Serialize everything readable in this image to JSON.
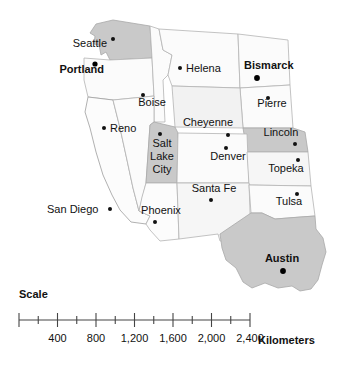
{
  "map": {
    "title": "Western United States reference map",
    "colors": {
      "background": "#ffffff",
      "state_fill_light": "#f7f7f7",
      "state_fill_lighter": "#fafafa",
      "state_fill_shaded": "#c9c9c9",
      "state_fill_shaded_light": "#d6d6d6",
      "state_border": "#b4b4b4",
      "coast_border": "#8f8f8f",
      "label_color": "#111111",
      "dot_color": "#111111"
    },
    "states": [
      {
        "name": "Washington",
        "shaded": true,
        "fill": "#c9c9c9"
      },
      {
        "name": "Oregon",
        "shaded": false,
        "fill": "#fafafa"
      },
      {
        "name": "Idaho",
        "shaded": false,
        "fill": "#fafafa"
      },
      {
        "name": "Montana",
        "shaded": false,
        "fill": "#fafafa"
      },
      {
        "name": "North Dakota",
        "shaded": false,
        "fill": "#fafafa"
      },
      {
        "name": "South Dakota",
        "shaded": false,
        "fill": "#fafafa"
      },
      {
        "name": "Wyoming",
        "shaded": false,
        "fill": "#f4f4f4"
      },
      {
        "name": "Nebraska",
        "shaded": true,
        "fill": "#c9c9c9"
      },
      {
        "name": "California",
        "shaded": false,
        "fill": "#fcfcfc"
      },
      {
        "name": "Nevada",
        "shaded": false,
        "fill": "#fafafa"
      },
      {
        "name": "Utah",
        "shaded": true,
        "fill": "#c9c9c9"
      },
      {
        "name": "Colorado",
        "shaded": false,
        "fill": "#fafafa"
      },
      {
        "name": "Kansas",
        "shaded": false,
        "fill": "#f7f7f7"
      },
      {
        "name": "Arizona",
        "shaded": false,
        "fill": "#fcfcfc"
      },
      {
        "name": "New Mexico",
        "shaded": false,
        "fill": "#f7f7f7"
      },
      {
        "name": "Oklahoma",
        "shaded": false,
        "fill": "#fafafa"
      },
      {
        "name": "Texas",
        "shaded": true,
        "fill": "#c9c9c9"
      }
    ],
    "cities": [
      {
        "label": "Seattle",
        "bold": false,
        "anchor": "end",
        "label_x": 107,
        "label_y": 47,
        "dot_x": 113,
        "dot_y": 39,
        "dot_r": 2.0
      },
      {
        "label": "Portland",
        "bold": true,
        "anchor": "end",
        "label_x": 104,
        "label_y": 73,
        "dot_x": 95,
        "dot_y": 64,
        "dot_r": 2.6
      },
      {
        "label": "Helena",
        "bold": false,
        "anchor": "start",
        "label_x": 186,
        "label_y": 72,
        "dot_x": 180,
        "dot_y": 68,
        "dot_r": 2.0
      },
      {
        "label": "Bismarck",
        "bold": true,
        "anchor": "start",
        "label_x": 244,
        "label_y": 69,
        "dot_x": 257,
        "dot_y": 78,
        "dot_r": 2.9
      },
      {
        "label": "Boise",
        "bold": false,
        "anchor": "middle",
        "label_x": 152,
        "label_y": 106,
        "dot_x": 143,
        "dot_y": 95,
        "dot_r": 2.0
      },
      {
        "label": "Pierre",
        "bold": false,
        "anchor": "middle",
        "label_x": 272,
        "label_y": 107,
        "dot_x": 268,
        "dot_y": 98,
        "dot_r": 2.0
      },
      {
        "label": "Cheyenne",
        "bold": false,
        "anchor": "middle",
        "label_x": 208,
        "label_y": 126,
        "dot_x": 228,
        "dot_y": 135,
        "dot_r": 2.0
      },
      {
        "label": "Reno",
        "bold": false,
        "anchor": "start",
        "label_x": 110,
        "label_y": 132,
        "dot_x": 104,
        "dot_y": 128,
        "dot_r": 2.0
      },
      {
        "label": "Lincoln",
        "bold": false,
        "anchor": "middle",
        "label_x": 281,
        "label_y": 136,
        "dot_x": 295,
        "dot_y": 144,
        "dot_r": 2.0
      },
      {
        "label": "Salt",
        "bold": false,
        "anchor": "middle",
        "label_x": 162,
        "label_y": 147,
        "dot_x": 160,
        "dot_y": 134,
        "dot_r": 2.0
      },
      {
        "label": "Lake",
        "bold": false,
        "anchor": "middle",
        "label_x": 162,
        "label_y": 160,
        "dot_x": null,
        "dot_y": null,
        "dot_r": 0
      },
      {
        "label": "City",
        "bold": false,
        "anchor": "middle",
        "label_x": 162,
        "label_y": 173,
        "dot_x": null,
        "dot_y": null,
        "dot_r": 0
      },
      {
        "label": "Denver",
        "bold": false,
        "anchor": "middle",
        "label_x": 228,
        "label_y": 160,
        "dot_x": 226,
        "dot_y": 148,
        "dot_r": 2.0
      },
      {
        "label": "Topeka",
        "bold": false,
        "anchor": "middle",
        "label_x": 286,
        "label_y": 172,
        "dot_x": 298,
        "dot_y": 160,
        "dot_r": 2.0
      },
      {
        "label": "Santa Fe",
        "bold": false,
        "anchor": "middle",
        "label_x": 214,
        "label_y": 192,
        "dot_x": 211,
        "dot_y": 200,
        "dot_r": 2.0
      },
      {
        "label": "Tulsa",
        "bold": false,
        "anchor": "middle",
        "label_x": 289,
        "label_y": 205,
        "dot_x": 297,
        "dot_y": 194,
        "dot_r": 2.0
      },
      {
        "label": "San Diego",
        "bold": false,
        "anchor": "start",
        "label_x": 47,
        "label_y": 213,
        "dot_x": 110,
        "dot_y": 209,
        "dot_r": 2.0
      },
      {
        "label": "Phoenix",
        "bold": false,
        "anchor": "middle",
        "label_x": 161,
        "label_y": 214,
        "dot_x": 155,
        "dot_y": 222,
        "dot_r": 2.0
      },
      {
        "label": "Austin",
        "bold": true,
        "anchor": "middle",
        "label_x": 282,
        "label_y": 262,
        "dot_x": 283,
        "dot_y": 271,
        "dot_r": 2.9
      }
    ]
  },
  "scale": {
    "title": "Scale",
    "unit_label": "Kilometers",
    "major_ticks": [
      {
        "value": "0",
        "show_label": false
      },
      {
        "value": "400",
        "show_label": true
      },
      {
        "value": "800",
        "show_label": true
      },
      {
        "value": "1,200",
        "show_label": true
      },
      {
        "value": "1,600",
        "show_label": true
      },
      {
        "value": "2,000",
        "show_label": true
      },
      {
        "value": "2,400",
        "show_label": true
      }
    ],
    "minor_tick_interval": "200",
    "range_km": [
      0,
      2400
    ],
    "bar_x_start": 19,
    "bar_x_end": 250,
    "bar_y": 320
  }
}
